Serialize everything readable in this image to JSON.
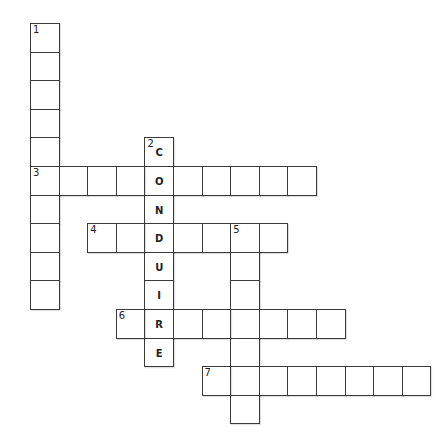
{
  "puzzle": {
    "origin": {
      "x": 30,
      "y": 23
    },
    "cell_size": 28.6,
    "entries": [
      {
        "number": "1",
        "direction": "down",
        "row": 0,
        "col": 0,
        "length": 10,
        "answer": ""
      },
      {
        "number": "2",
        "direction": "down",
        "row": 4,
        "col": 4,
        "length": 8,
        "answer": "CONDUIRE"
      },
      {
        "number": "3",
        "direction": "across",
        "row": 5,
        "col": 0,
        "length": 10,
        "answer": ""
      },
      {
        "number": "4",
        "direction": "across",
        "row": 7,
        "col": 2,
        "length": 7,
        "answer": ""
      },
      {
        "number": "5",
        "direction": "down",
        "row": 7,
        "col": 7,
        "length": 7,
        "answer": ""
      },
      {
        "number": "6",
        "direction": "across",
        "row": 10,
        "col": 3,
        "length": 8,
        "answer": ""
      },
      {
        "number": "7",
        "direction": "across",
        "row": 12,
        "col": 6,
        "length": 8,
        "answer": ""
      }
    ]
  }
}
